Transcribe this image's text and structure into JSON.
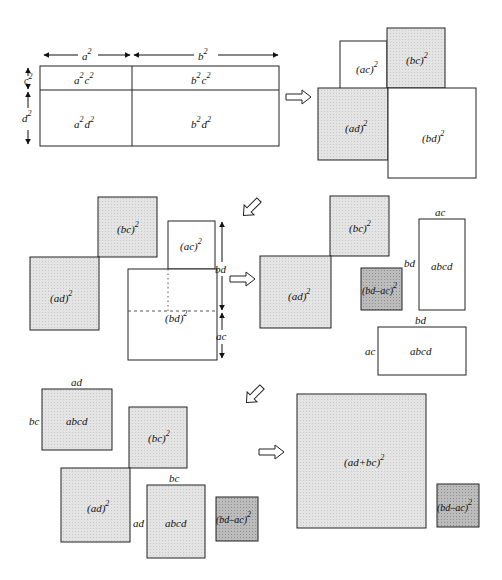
{
  "colors": {
    "stroke": "#222222",
    "light_fill": "#e6e6e6",
    "dark_fill": "#bdbdbd",
    "white_fill": "#ffffff"
  },
  "panel1": {
    "top_dims": [
      {
        "base": "a",
        "exp": "2"
      },
      {
        "base": "b",
        "exp": "2"
      }
    ],
    "side_dims": [
      {
        "base": "c",
        "exp": "2"
      },
      {
        "base": "d",
        "exp": "2"
      }
    ],
    "cells": [
      {
        "text": "a",
        "exp1": "2",
        "text2": "c",
        "exp2": "2"
      },
      {
        "text": "b",
        "exp1": "2",
        "text2": "c",
        "exp2": "2"
      },
      {
        "text": "a",
        "exp1": "2",
        "text2": "d",
        "exp2": "2"
      },
      {
        "text": "b",
        "exp1": "2",
        "text2": "d",
        "exp2": "2"
      }
    ]
  },
  "panel2": {
    "squares": [
      {
        "label": "(ac)",
        "exp": "2",
        "shade": "white"
      },
      {
        "label": "(bc)",
        "exp": "2",
        "shade": "light"
      },
      {
        "label": "(ad)",
        "exp": "2",
        "shade": "light"
      },
      {
        "label": "(bd)",
        "exp": "2",
        "shade": "white"
      }
    ]
  },
  "panel3_left": {
    "squares": [
      {
        "label": "(bc)",
        "exp": "2",
        "shade": "light"
      },
      {
        "label": "(ad)",
        "exp": "2",
        "shade": "light"
      },
      {
        "label": "(ac)",
        "exp": "2",
        "shade": "white"
      },
      {
        "label": "(bd)",
        "exp": "2",
        "shade": "white"
      }
    ],
    "dims": [
      "bd",
      "ac"
    ]
  },
  "panel3_right": {
    "squares": [
      {
        "label": "(bc)",
        "exp": "2",
        "shade": "light"
      },
      {
        "label": "(ad)",
        "exp": "2",
        "shade": "light"
      },
      {
        "label": "(bd–ac)",
        "exp": "2",
        "shade": "dark"
      }
    ],
    "rects": [
      {
        "label": "abcd",
        "top": "ac",
        "side": "bd"
      },
      {
        "label": "abcd",
        "top": "bd",
        "side": "ac"
      }
    ]
  },
  "panel4_left": {
    "rects": [
      {
        "label": "abcd",
        "top": "ad",
        "side": "bc"
      },
      {
        "label": "abcd",
        "top": "bc",
        "side": "ad"
      }
    ],
    "squares": [
      {
        "label": "(bc)",
        "exp": "2",
        "shade": "light"
      },
      {
        "label": "(ad)",
        "exp": "2",
        "shade": "light"
      },
      {
        "label": "(bd–ac)",
        "exp": "2",
        "shade": "dark"
      }
    ]
  },
  "panel4_right": {
    "squares": [
      {
        "label": "(ad+bc)",
        "exp": "2",
        "shade": "light"
      },
      {
        "label": "(bd–ac)",
        "exp": "2",
        "shade": "dark"
      }
    ]
  },
  "arrows": [
    "right-arrow",
    "down-left-arrow",
    "right-arrow",
    "down-left-arrow",
    "right-arrow"
  ]
}
